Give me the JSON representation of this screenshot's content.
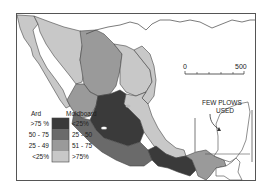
{
  "map": {
    "subject": "Plow usage in Mexico by region (Ard vs Moldboard)",
    "colors": {
      "frame": "#555555",
      "coast": "#444444",
      "class1": "#3a3a3a",
      "class2": "#6a6a6a",
      "class3": "#9a9a9a",
      "class4": "#c8c8c8",
      "background": "#ffffff"
    },
    "annotation": {
      "line1": "FEW PLOWS",
      "line2": "USED"
    },
    "scale_bar": {
      "start": "0",
      "end": "500"
    },
    "legend": {
      "ard_header": "Ard",
      "moldboard_header": "Moldboard",
      "rows": [
        {
          "ard": ">75 %",
          "moldboard": "<25%",
          "shade": "class1"
        },
        {
          "ard": "50 - 75",
          "moldboard": "25 - 50",
          "shade": "class2"
        },
        {
          "ard": "25 - 49",
          "moldboard": "51 - 75",
          "shade": "class3"
        },
        {
          "ard": "<25%",
          "moldboard": ">75%",
          "shade": "class4"
        }
      ]
    }
  }
}
